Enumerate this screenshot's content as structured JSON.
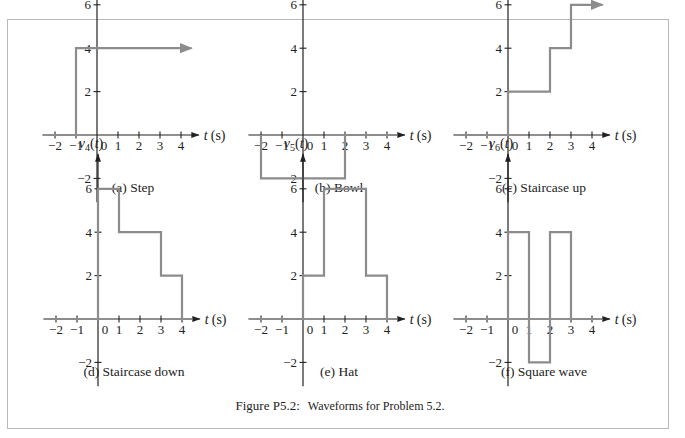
{
  "figure": {
    "caption_label": "Figure P5.2:",
    "caption_text": "Waveforms for Problem 5.2."
  },
  "colors": {
    "axis": "#222222",
    "waveform": "#8c8c8c",
    "frame": "#b8b8b8"
  },
  "chart_data": [
    {
      "type": "line",
      "id": "a",
      "title": "(a) Step",
      "ylabel": "v1(t)",
      "ylabel_base": "v",
      "ylabel_sub": "1",
      "xlabel": "t (s)",
      "xticks": [
        -2,
        -1,
        0,
        1,
        2,
        3,
        4
      ],
      "yticks": [
        -2,
        2,
        4,
        6
      ],
      "points": [
        [
          -2.3,
          0
        ],
        [
          -1,
          0
        ],
        [
          -1,
          4
        ],
        [
          4.5,
          4
        ]
      ],
      "arrow_end": true,
      "description": "v1(t) = 0 for t < -1, 4 for t >= -1 (continues)"
    },
    {
      "type": "line",
      "id": "b",
      "title": "(b) Bowl",
      "ylabel": "v2(t)",
      "ylabel_base": "v",
      "ylabel_sub": "2",
      "xlabel": "t (s)",
      "xticks": [
        -2,
        -1,
        0,
        1,
        2,
        3,
        4
      ],
      "yticks": [
        -2,
        2,
        4,
        6
      ],
      "points": [
        [
          -2,
          0
        ],
        [
          -2,
          -2
        ],
        [
          2,
          -2
        ],
        [
          2,
          0
        ],
        [
          4.5,
          0
        ]
      ],
      "arrow_end": false,
      "description": "v2(t) = -2 for -2 < t < 2, else 0"
    },
    {
      "type": "line",
      "id": "c",
      "title": "(c) Staircase up",
      "ylabel": "v3(t)",
      "ylabel_base": "v",
      "ylabel_sub": "3",
      "xlabel": "t (s)",
      "xticks": [
        -2,
        -1,
        0,
        1,
        2,
        3,
        4
      ],
      "yticks": [
        -2,
        2,
        4,
        6
      ],
      "points": [
        [
          -2.3,
          0
        ],
        [
          0,
          0
        ],
        [
          0,
          2
        ],
        [
          2,
          2
        ],
        [
          2,
          4
        ],
        [
          3,
          4
        ],
        [
          3,
          6
        ],
        [
          4.5,
          6
        ]
      ],
      "arrow_end": true,
      "description": "0 for t<0, 2 for 0<t<2, 4 for 2<t<3, 6 for t>3"
    },
    {
      "type": "line",
      "id": "d",
      "title": "(d) Staircase down",
      "ylabel": "v4(t)",
      "ylabel_base": "v",
      "ylabel_sub": "4",
      "xlabel": "t (s)",
      "xticks": [
        -2,
        -1,
        0,
        1,
        2,
        3,
        4
      ],
      "yticks": [
        -2,
        2,
        4,
        6
      ],
      "points": [
        [
          -2.3,
          0
        ],
        [
          0,
          0
        ],
        [
          0,
          6
        ],
        [
          1,
          6
        ],
        [
          1,
          4
        ],
        [
          3,
          4
        ],
        [
          3,
          2
        ],
        [
          4,
          2
        ],
        [
          4,
          0
        ],
        [
          4.5,
          0
        ]
      ],
      "arrow_end": false,
      "description": "6 for 0<t<1, 4 for 1<t<3, 2 for 3<t<4, else 0"
    },
    {
      "type": "line",
      "id": "e",
      "title": "(e) Hat",
      "ylabel": "v5(t)",
      "ylabel_base": "v",
      "ylabel_sub": "5",
      "xlabel": "t (s)",
      "xticks": [
        -2,
        -1,
        0,
        1,
        2,
        3,
        4
      ],
      "yticks": [
        -2,
        2,
        4,
        6
      ],
      "points": [
        [
          -2.3,
          0
        ],
        [
          0,
          0
        ],
        [
          0,
          2
        ],
        [
          1,
          2
        ],
        [
          1,
          6
        ],
        [
          3,
          6
        ],
        [
          3,
          2
        ],
        [
          4,
          2
        ],
        [
          4,
          0
        ],
        [
          4.5,
          0
        ]
      ],
      "arrow_end": false,
      "description": "2 for 0<t<1, 6 for 1<t<3, 2 for 3<t<4, else 0"
    },
    {
      "type": "line",
      "id": "f",
      "title": "(f) Square wave",
      "ylabel": "v6(t)",
      "ylabel_base": "v",
      "ylabel_sub": "6",
      "xlabel": "t (s)",
      "xticks": [
        -2,
        -1,
        0,
        1,
        2,
        3,
        4
      ],
      "yticks": [
        -2,
        2,
        4,
        6
      ],
      "points": [
        [
          -2.3,
          0
        ],
        [
          0,
          0
        ],
        [
          0,
          4
        ],
        [
          1,
          4
        ],
        [
          1,
          -2
        ],
        [
          2,
          -2
        ],
        [
          2,
          4
        ],
        [
          3,
          4
        ],
        [
          3,
          0
        ],
        [
          4.5,
          0
        ]
      ],
      "arrow_end": false,
      "description": "4 for 0<t<1, -2 for 1<t<2, 4 for 2<t<3, else 0"
    }
  ]
}
